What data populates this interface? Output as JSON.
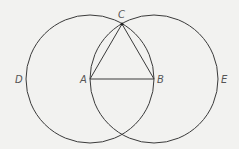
{
  "diagram": {
    "colors": {
      "background": "#f2f2f0",
      "stroke": "#3a3a3a",
      "label": "#555555"
    },
    "points": {
      "A": {
        "label": "A",
        "x": 90,
        "y": 79
      },
      "B": {
        "label": "B",
        "x": 154,
        "y": 79
      },
      "C": {
        "label": "C",
        "x": 122,
        "y": 24
      },
      "D": {
        "label": "D",
        "x": 19,
        "y": 83
      },
      "E": {
        "label": "E",
        "x": 224,
        "y": 83
      }
    },
    "circles": [
      {
        "name": "circle-centered-A",
        "cx": 90,
        "cy": 79,
        "r": 64
      },
      {
        "name": "circle-centered-B",
        "cx": 154,
        "cy": 79,
        "r": 64
      }
    ],
    "segments": [
      {
        "name": "segment-AB",
        "from": "A",
        "to": "B"
      },
      {
        "name": "segment-AC",
        "from": "A",
        "to": "C"
      },
      {
        "name": "segment-BC",
        "from": "B",
        "to": "C"
      }
    ]
  }
}
